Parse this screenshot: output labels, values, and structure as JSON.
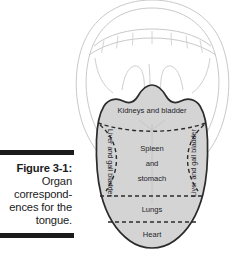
{
  "figure": {
    "caption_label": "Figure 3-1:",
    "caption_body": "Organ correspond-ences for the tongue.",
    "caption_lines": [
      "Organ",
      "correspond-",
      "ences for",
      "the tongue."
    ],
    "rule_color": "#1b1b1b"
  },
  "diagram": {
    "tongue_fill": "#d4d4d4",
    "tongue_stroke": "#2b2b2b",
    "mouth_stroke": "#c9c9c9",
    "divider_style": "dashed",
    "zones": [
      {
        "id": "kidneys-bladder",
        "label": "Kidneys and bladder",
        "position": "top",
        "orientation": "horizontal"
      },
      {
        "id": "liver-gallbladder-left",
        "label": "Liver and gall bladder",
        "position": "left",
        "orientation": "rotated-cw"
      },
      {
        "id": "spleen-stomach",
        "label_lines": [
          "Spleen",
          "and",
          "stomach"
        ],
        "position": "center",
        "orientation": "horizontal"
      },
      {
        "id": "liver-gallbladder-right",
        "label": "Liver and gall bladder",
        "position": "right",
        "orientation": "rotated-ccw"
      },
      {
        "id": "lungs",
        "label": "Lungs",
        "position": "lower",
        "orientation": "horizontal"
      },
      {
        "id": "heart",
        "label": "Heart",
        "position": "tip",
        "orientation": "horizontal"
      }
    ],
    "zone_text": {
      "kidneys": "Kidneys and bladder",
      "liver_left": "Liver and gall bladder",
      "liver_right": "Liver and gall bladder",
      "spleen_1": "Spleen",
      "spleen_2": "and",
      "spleen_3": "stomach",
      "lungs": "Lungs",
      "heart": "Heart"
    }
  }
}
